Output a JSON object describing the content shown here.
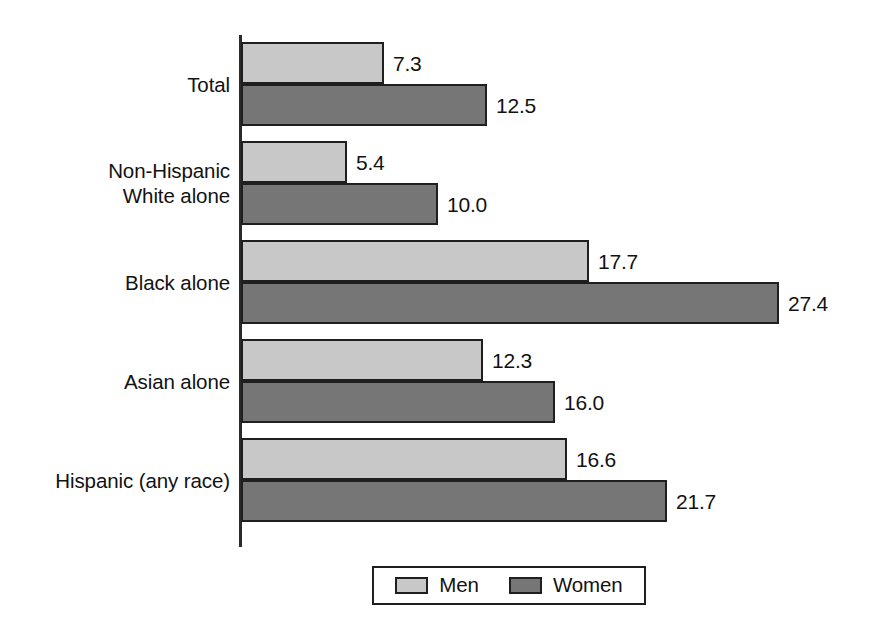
{
  "chart_data": {
    "type": "bar",
    "orientation": "horizontal",
    "title": "",
    "subtitle": "",
    "xlabel": "",
    "ylabel": "",
    "grid": false,
    "legend_position": "bottom-center",
    "axis_visible": "left-only",
    "xlim": [
      0,
      27.4
    ],
    "categories": [
      "Total",
      "Non-Hispanic\nWhite alone",
      "Black alone",
      "Asian alone",
      "Hispanic (any race)"
    ],
    "series": [
      {
        "name": "Men",
        "color": "#c8c8c8",
        "values": [
          7.3,
          5.4,
          17.7,
          12.3,
          16.6
        ],
        "labels": [
          "7.3",
          "5.4",
          "17.7",
          "12.3",
          "16.6"
        ]
      },
      {
        "name": "Women",
        "color": "#767676",
        "values": [
          12.5,
          10.0,
          27.4,
          16.0,
          21.7
        ],
        "labels": [
          "12.5",
          "10.0",
          "27.4",
          "16.0",
          "21.7"
        ]
      }
    ]
  },
  "legend": {
    "entries": [
      {
        "label": "Men",
        "swatch": "men-swatch"
      },
      {
        "label": "Women",
        "swatch": "women-swatch"
      }
    ]
  },
  "colors": {
    "men": "#c8c8c8",
    "women": "#767676",
    "outline": "#1f1f1f",
    "text": "#121212",
    "background": "#ffffff"
  },
  "layout": {
    "axis_x_px": 240,
    "px_per_unit": 19.65,
    "bar_height_px": 42,
    "group_gap_px": 15
  }
}
